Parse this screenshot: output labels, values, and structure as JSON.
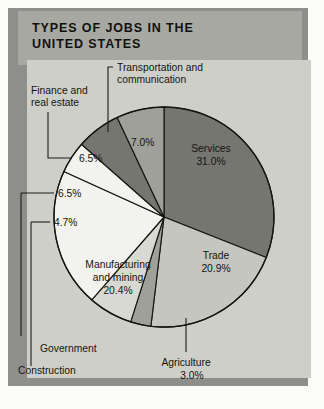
{
  "figure": {
    "title_line_1": "TYPES OF JOBS IN THE",
    "title_line_2": "UNITED STATES"
  },
  "colors": {
    "banner_bg": "#a8a8a2",
    "panel_bg": "#cfcfca",
    "shadow": "#8e8e8b",
    "outline": "#16160f",
    "slice_dark_gray": "#767670",
    "slice_medium_gray": "#a0a09a",
    "slice_light_gray": "#c6c6c0",
    "slice_pale_gray": "#d9d9d3",
    "slice_white": "#f2f2ee",
    "text": "#15150f"
  },
  "labels": {
    "services": "Services",
    "trade": "Trade",
    "agriculture": "Agriculture",
    "manufacturing_line_1": "Manufacturing",
    "manufacturing_line_2": "and mining",
    "construction": "Construction",
    "government": "Government",
    "finance_line_1": "Finance and",
    "finance_line_2": "real estate",
    "transportation_line_1": "Transportation and",
    "transportation_line_2": "communication"
  },
  "percents": {
    "services": "31.0%",
    "trade": "20.9%",
    "agriculture": "3.0%",
    "manufacturing": "20.4%",
    "construction": "4.7%",
    "government": "6.5%",
    "finance": "6.5%",
    "transportation": "7.0%"
  },
  "chart_data": {
    "type": "pie",
    "title": "TYPES OF JOBS IN THE UNITED STATES",
    "subtitle": "",
    "xlabel": "",
    "ylabel": "",
    "grid": false,
    "legend_position": "none",
    "units": "percent of total jobs",
    "total": 100.0,
    "start_angle_deg": 0,
    "direction": "clockwise",
    "center_px": [
      164,
      217
    ],
    "radius_px": 110,
    "labels": [
      "Services",
      "Trade",
      "Agriculture",
      "Government",
      "Manufacturing and mining",
      "Construction",
      "Finance and real estate",
      "Transportation and communication"
    ],
    "values": [
      31.0,
      20.9,
      3.0,
      6.5,
      20.4,
      4.7,
      6.5,
      7.0
    ],
    "value_labels": [
      "31.0%",
      "20.9%",
      "3.0%",
      "6.5%",
      "20.4%",
      "4.7%",
      "6.5%",
      "7.0%"
    ],
    "slice_fills": [
      "#767670",
      "#c6c6c0",
      "#a0a09a",
      "#d9d9d3",
      "#f2f2ee",
      "#f2f2ee",
      "#767670",
      "#a0a09a"
    ],
    "label_placement": [
      "inside",
      "inside",
      "leader-below",
      "leader-left",
      "inside",
      "leader-left",
      "leader-left",
      "leader-above"
    ]
  }
}
